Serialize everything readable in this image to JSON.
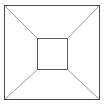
{
  "figure": {
    "background_color": "#ffffff",
    "width": 104,
    "height": 106,
    "outer_square": {
      "name": "outer-square",
      "stroke_color": "#4a4a4a",
      "stroke_width": 1,
      "x": 4.5,
      "y": 5.5,
      "width": 95,
      "height": 94
    },
    "inner_square": {
      "name": "inner-square",
      "stroke_color": "#5a5a5a",
      "stroke_width": 1,
      "x": 37.5,
      "y": 38.5,
      "width": 30,
      "height": 31
    },
    "diagonals": {
      "stroke_color": "#9a9a9a",
      "stroke_width": 1,
      "lines": [
        {
          "name": "diagonal-top-left",
          "x1": 4.5,
          "y1": 5.5,
          "x2": 37.5,
          "y2": 38.5
        },
        {
          "name": "diagonal-top-right",
          "x1": 99.5,
          "y1": 5.5,
          "x2": 67.5,
          "y2": 38.5
        },
        {
          "name": "diagonal-bottom-left",
          "x1": 4.5,
          "y1": 99.5,
          "x2": 37.5,
          "y2": 69.5
        },
        {
          "name": "diagonal-bottom-right",
          "x1": 99.5,
          "y1": 99.5,
          "x2": 67.5,
          "y2": 69.5
        }
      ]
    },
    "faces": [
      {
        "name": "face-top",
        "points": "4.5,5.5 99.5,5.5 67.5,38.5 37.5,38.5"
      },
      {
        "name": "face-right",
        "points": "99.5,5.5 99.5,99.5 67.5,69.5 67.5,38.5"
      },
      {
        "name": "face-bottom",
        "points": "99.5,99.5 4.5,99.5 37.5,69.5 67.5,69.5"
      },
      {
        "name": "face-left",
        "points": "4.5,99.5 4.5,5.5 37.5,38.5 37.5,69.5"
      },
      {
        "name": "face-back",
        "points": "37.5,38.5 67.5,38.5 67.5,69.5 37.5,69.5"
      }
    ]
  }
}
